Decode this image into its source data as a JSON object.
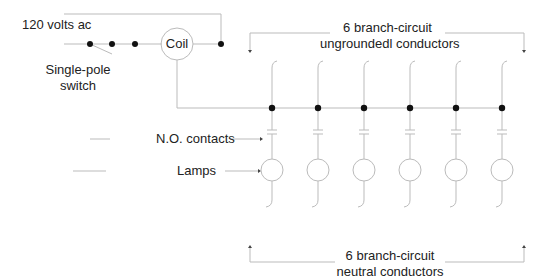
{
  "labels": {
    "supply": "120 volts ac",
    "switch_line1": "Single-pole",
    "switch_line2": "switch",
    "coil": "Coil",
    "top_line1": "6 branch-circuit",
    "top_line2": "ungroundedl conductors",
    "contacts": "N.O. contacts",
    "lamps": "Lamps",
    "bottom_line1": "6 branch-circuit",
    "bottom_line2": "neutral conductors"
  },
  "branches": {
    "count": 6,
    "x_positions": [
      272,
      318,
      364,
      410,
      456,
      502
    ]
  },
  "colors": {
    "wire": "#bbbbbb",
    "node": "#111111",
    "text": "#222222"
  }
}
